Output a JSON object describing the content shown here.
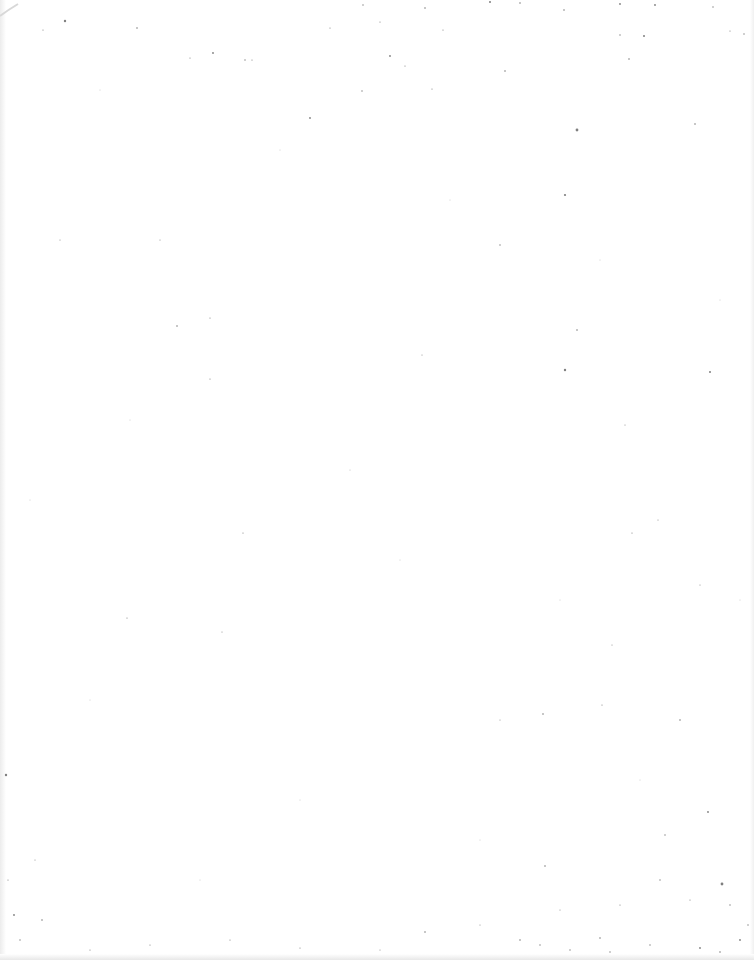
{
  "page": {
    "type": "blank-scanned-page",
    "background_color": "#ffffff",
    "speckle_color": "#555555",
    "text_content": []
  }
}
